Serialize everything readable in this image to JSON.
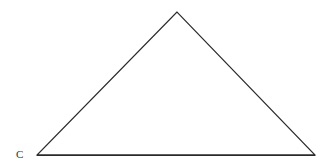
{
  "diagram": {
    "type": "triangle",
    "vertices": {
      "apex": {
        "x": 177,
        "y": 12
      },
      "left": {
        "x": 37,
        "y": 155
      },
      "right": {
        "x": 315,
        "y": 155
      }
    },
    "labels": [
      {
        "text": "C",
        "x": 16,
        "y": 158
      }
    ],
    "stroke_color": "#2a2a2a",
    "background": "#ffffff"
  }
}
